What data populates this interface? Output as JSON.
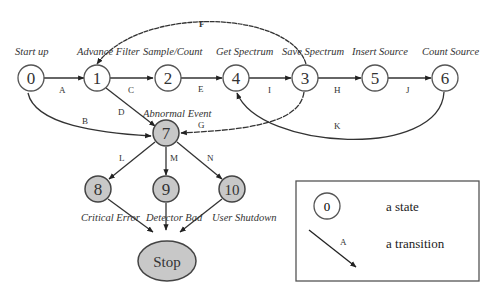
{
  "diagram": {
    "type": "state-transition",
    "states": [
      {
        "id": "0",
        "label": "Start up",
        "abnormal": false
      },
      {
        "id": "1",
        "label": "Advance Filter",
        "abnormal": false
      },
      {
        "id": "2",
        "label": "Sample/Count",
        "abnormal": false
      },
      {
        "id": "4",
        "label": "Get Spectrum",
        "abnormal": false
      },
      {
        "id": "3",
        "label": "Save Spectrum",
        "abnormal": false
      },
      {
        "id": "5",
        "label": "Insert Source",
        "abnormal": false
      },
      {
        "id": "6",
        "label": "Count Source",
        "abnormal": false
      },
      {
        "id": "7",
        "label": "Abnormal Event",
        "abnormal": true
      },
      {
        "id": "8",
        "label": "Critical Error",
        "abnormal": true
      },
      {
        "id": "9",
        "label": "Detector Bad",
        "abnormal": true
      },
      {
        "id": "10",
        "label": "User Shutdown",
        "abnormal": true
      },
      {
        "id": "Stop",
        "label": "",
        "abnormal": true
      }
    ],
    "transitions": [
      {
        "label": "A",
        "from": "0",
        "to": "1"
      },
      {
        "label": "B",
        "from": "0",
        "to": "7"
      },
      {
        "label": "C",
        "from": "1",
        "to": "2"
      },
      {
        "label": "D",
        "from": "1",
        "to": "7"
      },
      {
        "label": "E",
        "from": "2",
        "to": "4"
      },
      {
        "label": "F",
        "from": "3",
        "to": "1"
      },
      {
        "label": "G",
        "from": "3",
        "to": "7"
      },
      {
        "label": "H",
        "from": "3",
        "to": "5"
      },
      {
        "label": "I",
        "from": "4",
        "to": "3"
      },
      {
        "label": "J",
        "from": "5",
        "to": "6"
      },
      {
        "label": "K",
        "from": "6",
        "to": "4"
      },
      {
        "label": "L",
        "from": "7",
        "to": "8"
      },
      {
        "label": "M",
        "from": "7",
        "to": "9"
      },
      {
        "label": "N",
        "from": "7",
        "to": "10"
      },
      {
        "from": "8",
        "to": "Stop"
      },
      {
        "from": "9",
        "to": "Stop"
      },
      {
        "from": "10",
        "to": "Stop"
      }
    ]
  },
  "legend": {
    "state_symbol": "0",
    "state_text": "a state",
    "transition_symbol": "A",
    "transition_text": "a transition"
  },
  "colors": {
    "normal_fill": "#ffffff",
    "abnormal_fill": "#c8c8c8",
    "stroke": "#555555"
  }
}
